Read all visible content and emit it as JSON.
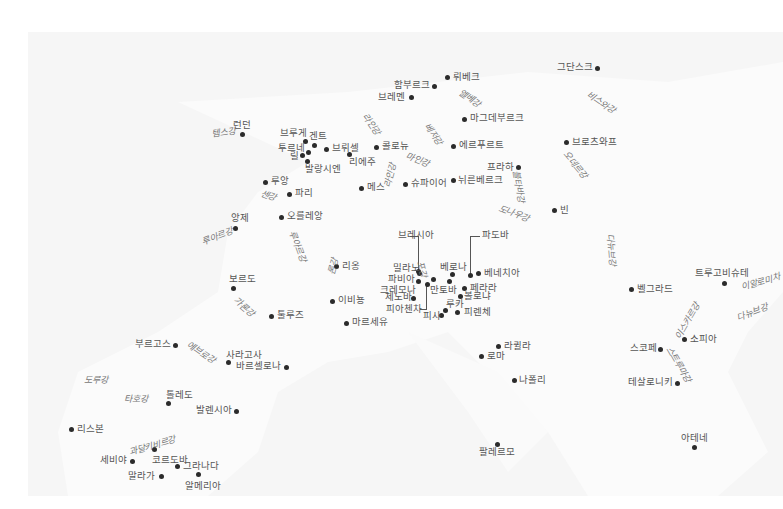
{
  "map": {
    "title": "",
    "cities": [
      {
        "name": "그단스크",
        "x": 597,
        "y": 68,
        "lx": 557,
        "ly": 62
      },
      {
        "name": "뤼베크",
        "x": 447,
        "y": 77,
        "lx": 453,
        "ly": 72
      },
      {
        "name": "함부르크",
        "x": 434,
        "y": 86,
        "lx": 394,
        "ly": 80
      },
      {
        "name": "브레멘",
        "x": 411,
        "y": 97,
        "lx": 378,
        "ly": 92
      },
      {
        "name": "마그데부르크",
        "x": 464,
        "y": 119,
        "lx": 470,
        "ly": 113
      },
      {
        "name": "에르푸르트",
        "x": 453,
        "y": 146,
        "lx": 459,
        "ly": 140
      },
      {
        "name": "브로츠와프",
        "x": 566,
        "y": 142,
        "lx": 572,
        "ly": 137
      },
      {
        "name": "프라하",
        "x": 518,
        "y": 167,
        "lx": 487,
        "ly": 162
      },
      {
        "name": "뉘른베르크",
        "x": 453,
        "y": 180,
        "lx": 458,
        "ly": 175
      },
      {
        "name": "슈파이어",
        "x": 405,
        "y": 184,
        "lx": 411,
        "ly": 178
      },
      {
        "name": "빈",
        "x": 554,
        "y": 210,
        "lx": 560,
        "ly": 205
      },
      {
        "name": "콜로뉴",
        "x": 376,
        "y": 147,
        "lx": 382,
        "ly": 141
      },
      {
        "name": "메스",
        "x": 361,
        "y": 188,
        "lx": 367,
        "ly": 182
      },
      {
        "name": "런던",
        "x": 242,
        "y": 134,
        "lx": 233,
        "ly": 120
      },
      {
        "name": "브루게",
        "x": 305,
        "y": 141,
        "lx": 280,
        "ly": 128
      },
      {
        "name": "겐트",
        "x": 314,
        "y": 145,
        "lx": 309,
        "ly": 131
      },
      {
        "name": "투르네",
        "x": 308,
        "y": 152,
        "lx": 278,
        "ly": 143
      },
      {
        "name": "릴",
        "x": 302,
        "y": 155,
        "lx": 290,
        "ly": 151
      },
      {
        "name": "브뤼셀",
        "x": 326,
        "y": 149,
        "lx": 332,
        "ly": 143
      },
      {
        "name": "리에주",
        "x": 349,
        "y": 154,
        "lx": 349,
        "ly": 157
      },
      {
        "name": "발랑시엔",
        "x": 307,
        "y": 161,
        "lx": 305,
        "ly": 164
      },
      {
        "name": "루앙",
        "x": 265,
        "y": 182,
        "lx": 271,
        "ly": 176
      },
      {
        "name": "파리",
        "x": 289,
        "y": 194,
        "lx": 295,
        "ly": 188
      },
      {
        "name": "오를레앙",
        "x": 281,
        "y": 217,
        "lx": 287,
        "ly": 211
      },
      {
        "name": "앙제",
        "x": 235,
        "y": 228,
        "lx": 231,
        "ly": 213
      },
      {
        "name": "리옹",
        "x": 336,
        "y": 266,
        "lx": 342,
        "ly": 261
      },
      {
        "name": "이비뇽",
        "x": 332,
        "y": 301,
        "lx": 338,
        "ly": 295
      },
      {
        "name": "마르세유",
        "x": 346,
        "y": 323,
        "lx": 352,
        "ly": 317
      },
      {
        "name": "보르도",
        "x": 233,
        "y": 288,
        "lx": 229,
        "ly": 274
      },
      {
        "name": "툴루즈",
        "x": 271,
        "y": 316,
        "lx": 277,
        "ly": 310
      },
      {
        "name": "브레시아",
        "x": 418,
        "y": 271,
        "lx": 398,
        "ly": 230
      },
      {
        "name": "파도바",
        "x": 470,
        "y": 275,
        "lx": 482,
        "ly": 230
      },
      {
        "name": "밀라노",
        "x": 419,
        "y": 273,
        "lx": 393,
        "ly": 263
      },
      {
        "name": "베로나",
        "x": 452,
        "y": 274,
        "lx": 440,
        "ly": 262
      },
      {
        "name": "베네치아",
        "x": 478,
        "y": 273,
        "lx": 484,
        "ly": 268
      },
      {
        "name": "파비아",
        "x": 418,
        "y": 281,
        "lx": 388,
        "ly": 274
      },
      {
        "name": "크레모나",
        "x": 433,
        "y": 279,
        "lx": 380,
        "ly": 285
      },
      {
        "name": "만토바",
        "x": 449,
        "y": 281,
        "lx": 430,
        "ly": 285
      },
      {
        "name": "페라라",
        "x": 464,
        "y": 288,
        "lx": 470,
        "ly": 283
      },
      {
        "name": "제노바",
        "x": 413,
        "y": 298,
        "lx": 385,
        "ly": 292
      },
      {
        "name": "볼로냐",
        "x": 460,
        "y": 296,
        "lx": 464,
        "ly": 291
      },
      {
        "name": "피아첸차",
        "x": 427,
        "y": 284,
        "lx": 386,
        "ly": 304
      },
      {
        "name": "루카",
        "x": 445,
        "y": 310,
        "lx": 446,
        "ly": 299
      },
      {
        "name": "피사",
        "x": 441,
        "y": 315,
        "lx": 423,
        "ly": 311
      },
      {
        "name": "피렌체",
        "x": 457,
        "y": 312,
        "lx": 464,
        "ly": 307
      },
      {
        "name": "라퀼라",
        "x": 498,
        "y": 346,
        "lx": 504,
        "ly": 341
      },
      {
        "name": "로마",
        "x": 481,
        "y": 356,
        "lx": 487,
        "ly": 351
      },
      {
        "name": "나폴리",
        "x": 514,
        "y": 380,
        "lx": 519,
        "ly": 375
      },
      {
        "name": "팔레르모",
        "x": 497,
        "y": 444,
        "lx": 479,
        "ly": 447
      },
      {
        "name": "벨그라드",
        "x": 631,
        "y": 289,
        "lx": 637,
        "ly": 284
      },
      {
        "name": "트루고비슈테",
        "x": 724,
        "y": 283,
        "lx": 695,
        "ly": 268
      },
      {
        "name": "소피아",
        "x": 684,
        "y": 339,
        "lx": 690,
        "ly": 334
      },
      {
        "name": "스코페",
        "x": 660,
        "y": 349,
        "lx": 630,
        "ly": 343
      },
      {
        "name": "테살로니키",
        "x": 677,
        "y": 383,
        "lx": 628,
        "ly": 377
      },
      {
        "name": "아테네",
        "x": 694,
        "y": 447,
        "lx": 681,
        "ly": 433
      },
      {
        "name": "부르고스",
        "x": 175,
        "y": 345,
        "lx": 135,
        "ly": 339
      },
      {
        "name": "사라고사",
        "x": 228,
        "y": 362,
        "lx": 226,
        "ly": 350
      },
      {
        "name": "바르셀로나",
        "x": 286,
        "y": 367,
        "lx": 236,
        "ly": 361
      },
      {
        "name": "톨레도",
        "x": 168,
        "y": 403,
        "lx": 166,
        "ly": 390
      },
      {
        "name": "발렌시아",
        "x": 236,
        "y": 411,
        "lx": 196,
        "ly": 405
      },
      {
        "name": "리스본",
        "x": 71,
        "y": 429,
        "lx": 77,
        "ly": 424
      },
      {
        "name": "세비야",
        "x": 132,
        "y": 461,
        "lx": 100,
        "ly": 455
      },
      {
        "name": "코르도바",
        "x": 154,
        "y": 449,
        "lx": 152,
        "ly": 455
      },
      {
        "name": "그라나다",
        "x": 177,
        "y": 466,
        "lx": 183,
        "ly": 461
      },
      {
        "name": "말라가",
        "x": 161,
        "y": 476,
        "lx": 128,
        "ly": 471
      },
      {
        "name": "알메리아",
        "x": 198,
        "y": 474,
        "lx": 185,
        "ly": 481
      }
    ],
    "rivers": [
      {
        "name": "템스강",
        "x": 211,
        "y": 130,
        "r": -8
      },
      {
        "name": "엘베강",
        "x": 462,
        "y": 88,
        "r": 35
      },
      {
        "name": "비스와강",
        "x": 590,
        "y": 90,
        "r": 35
      },
      {
        "name": "라인강",
        "x": 368,
        "y": 112,
        "r": 55
      },
      {
        "name": "베저강",
        "x": 430,
        "y": 122,
        "r": 55
      },
      {
        "name": "마인강",
        "x": 408,
        "y": 152,
        "r": 22
      },
      {
        "name": "오데르강",
        "x": 568,
        "y": 150,
        "r": 50
      },
      {
        "name": "블타바강",
        "x": 520,
        "y": 170,
        "r": 80
      },
      {
        "name": "도나우강",
        "x": 500,
        "y": 204,
        "r": 20
      },
      {
        "name": "라인강",
        "x": 383,
        "y": 186,
        "r": -75
      },
      {
        "name": "센강",
        "x": 262,
        "y": 189,
        "r": 20
      },
      {
        "name": "루아르강",
        "x": 201,
        "y": 238,
        "r": -20
      },
      {
        "name": "루아르강",
        "x": 296,
        "y": 230,
        "r": 70
      },
      {
        "name": "론강",
        "x": 327,
        "y": 273,
        "r": -75
      },
      {
        "name": "가론강",
        "x": 237,
        "y": 296,
        "r": 40
      },
      {
        "name": "포강",
        "x": 424,
        "y": 260,
        "r": 75
      },
      {
        "name": "다뉴브강",
        "x": 614,
        "y": 233,
        "r": 85
      },
      {
        "name": "다뉴브강",
        "x": 736,
        "y": 314,
        "r": -20
      },
      {
        "name": "이알로미차",
        "x": 740,
        "y": 283,
        "r": -15
      },
      {
        "name": "이스카르강",
        "x": 674,
        "y": 336,
        "r": -60
      },
      {
        "name": "스트루마강",
        "x": 672,
        "y": 345,
        "r": 60
      },
      {
        "name": "에브로강",
        "x": 190,
        "y": 340,
        "r": 35
      },
      {
        "name": "도루강",
        "x": 84,
        "y": 376,
        "r": 0
      },
      {
        "name": "타호강",
        "x": 124,
        "y": 395,
        "r": 0
      },
      {
        "name": "과달키비르강",
        "x": 128,
        "y": 448,
        "r": -15
      }
    ],
    "leaders": [
      {
        "x": 418,
        "y": 236,
        "w": 1,
        "h": 35
      },
      {
        "x": 410,
        "y": 236,
        "w": 8,
        "h": 1
      },
      {
        "x": 470,
        "y": 236,
        "w": 1,
        "h": 39
      },
      {
        "x": 470,
        "y": 236,
        "w": 10,
        "h": 1
      },
      {
        "x": 426,
        "y": 284,
        "w": 1,
        "h": 25
      },
      {
        "x": 420,
        "y": 309,
        "w": 7,
        "h": 1
      }
    ]
  }
}
